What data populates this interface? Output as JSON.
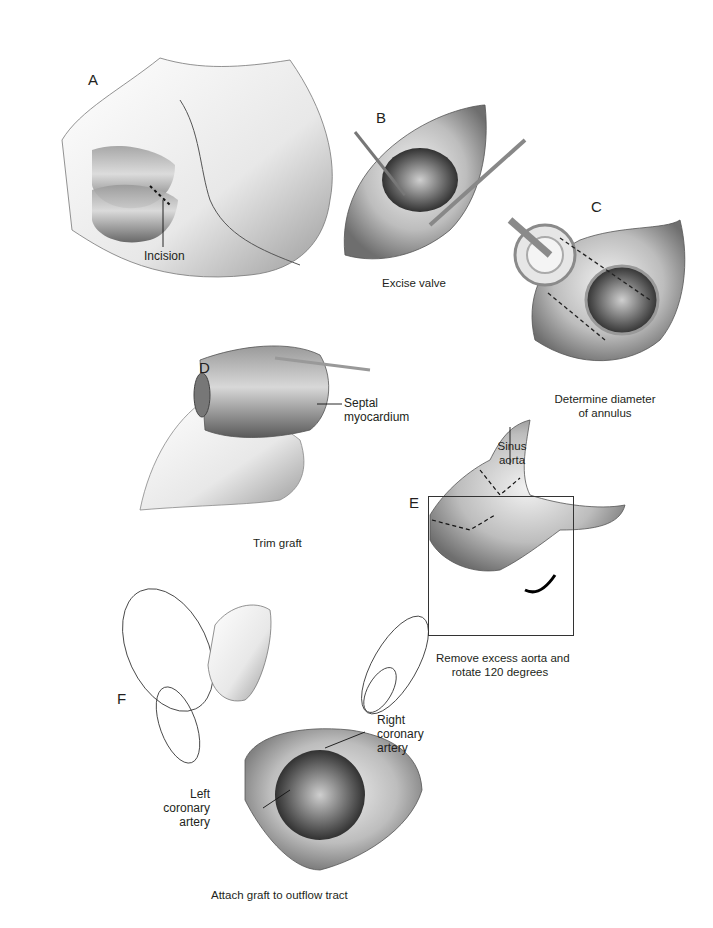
{
  "figure": {
    "panels": [
      {
        "id": "A",
        "letter": "A",
        "labels": [
          "Incision"
        ],
        "caption": ""
      },
      {
        "id": "B",
        "letter": "B",
        "labels": [],
        "caption": "Excise valve"
      },
      {
        "id": "C",
        "letter": "C",
        "labels": [],
        "caption_lines": [
          "Determine diameter",
          "of annulus"
        ]
      },
      {
        "id": "D",
        "letter": "D",
        "labels": [
          "Septal",
          "myocardium"
        ],
        "caption": "Trim graft"
      },
      {
        "id": "E",
        "letter": "E",
        "labels": [
          "Sinus",
          "aorta"
        ],
        "caption_lines": [
          "Remove excess aorta and",
          "rotate 120 degrees"
        ]
      },
      {
        "id": "F",
        "letter": "F",
        "labels": [
          "Right",
          "coronary",
          "artery",
          "Left",
          "coronary",
          "artery"
        ],
        "caption": "Attach graft to outflow tract"
      }
    ]
  },
  "A": {
    "letter": "A",
    "incision": "Incision"
  },
  "B": {
    "letter": "B",
    "caption": "Excise valve"
  },
  "C": {
    "letter": "C",
    "caption_1": "Determine diameter",
    "caption_2": "of annulus"
  },
  "D": {
    "letter": "D",
    "label_1": "Septal",
    "label_2": "myocardium",
    "caption": "Trim graft"
  },
  "E": {
    "letter": "E",
    "label_1": "Sinus",
    "label_2": "aorta",
    "caption_1": "Remove excess aorta and",
    "caption_2": "rotate 120 degrees"
  },
  "F": {
    "letter": "F",
    "right_1": "Right",
    "right_2": "coronary",
    "right_3": "artery",
    "left_1": "Left",
    "left_2": "coronary",
    "left_3": "artery",
    "caption": "Attach graft to outflow tract"
  }
}
